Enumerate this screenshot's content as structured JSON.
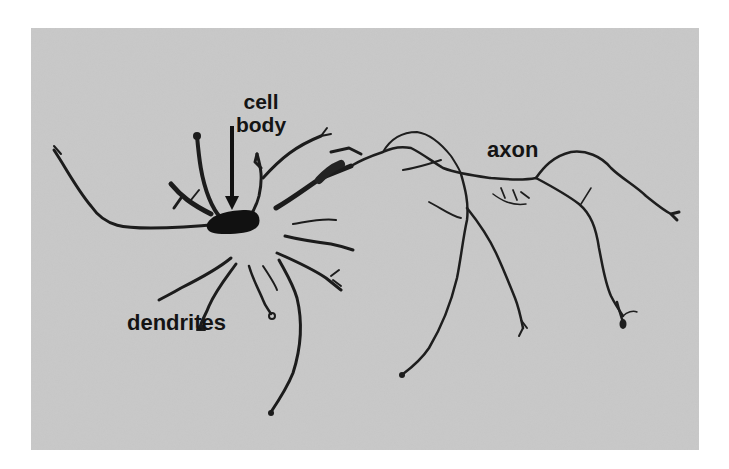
{
  "figure": {
    "background_color": "#c9c9c9",
    "stain_color": "#1a1a1a",
    "labels": {
      "cell_body_line1": "cell",
      "cell_body_line2": "body",
      "axon": "axon",
      "dendrites": "dendrites"
    },
    "annotations": [
      {
        "label": "cell body",
        "pointer": "arrow-down",
        "target": "soma"
      },
      {
        "label": "axon",
        "pointer": "none",
        "target": "axon"
      },
      {
        "label": "dendrites",
        "pointer": "none",
        "target": "dendrites"
      }
    ]
  }
}
